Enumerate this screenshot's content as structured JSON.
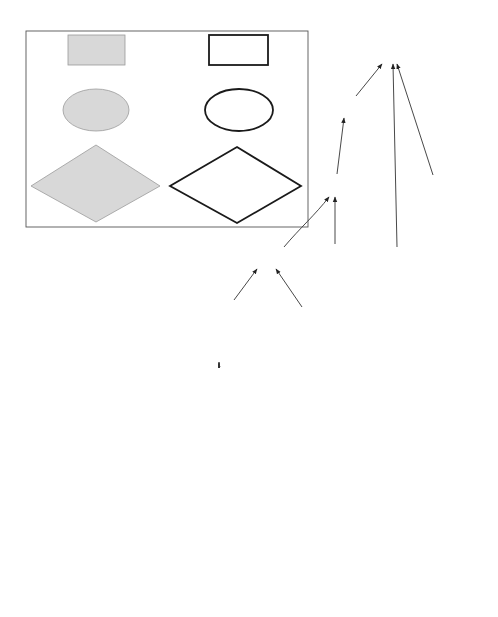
{
  "legend": {
    "source_event": {
      "id": "1.2.3.",
      "l1": "source event and",
      "l2": "its description"
    },
    "internal_event": {
      "id": "1.2.3.",
      "l1": "internal event and",
      "l2": "its description"
    },
    "source_state": {
      "id": "1.2.3.",
      "l1": "source state and",
      "l2": "its description"
    },
    "internal_state": {
      "id": "1.2.3.",
      "l1": "internal state and",
      "l2": "its description"
    },
    "source_process": {
      "id": "1.2.3.",
      "l1": "source process",
      "l2": "= source state/event and",
      "l3": "its description"
    },
    "internal_process": {
      "id": "1.2.3.",
      "l1": "internal process",
      "l2": "= internal state/event and",
      "l3": "its description"
    }
  },
  "nodes": {
    "n0": {
      "id": "0",
      "l1": "accident",
      "shape": "internal-event"
    },
    "n1": {
      "id": "1",
      "l1": "death of 1st person",
      "shape": "internal-event"
    },
    "n2": {
      "id": "2",
      "l1": "death of 2nd person",
      "shape": "internal-event"
    },
    "n21": {
      "id": "2.1",
      "l1": "asphyxiation",
      "shape": "internal-event"
    },
    "n211": {
      "id": "2.1.1",
      "l1": "smoke in cabin",
      "shape": "internal-state"
    },
    "n212": {
      "id": "2.1.2",
      "l1": "remained in cabin",
      "shape": "internal-event"
    },
    "n2121": {
      "id": "2.1.2.1",
      "l1": "unconsciousness",
      "shape": "internal-state"
    },
    "n2122": {
      "id": "2.1.2.2",
      "l1": "unnoticed during",
      "l2": "evacuation",
      "shape": "internal-process"
    },
    "n21221": {
      "id": "2.1.2.2.1",
      "l1": "motionless, noiseless,",
      "l2": "position, smoke in cabin,",
      "l3": "time pressure, etc.",
      "shape": "source-process"
    },
    "n3": {
      "id": "3",
      "l1": "damage to AC",
      "shape": "internal-event"
    },
    "n31": {
      "id": "3.1",
      "l1": "AC hits earth bank",
      "shape": "source-event"
    },
    "n311": {
      "id": "3.1.1",
      "l1": "AC overruns RWY",
      "shape": "source-event"
    },
    "n312": {
      "id": "3.1.2",
      "l1": "earth bank in",
      "l2": "overrun path",
      "shape": "internal-state"
    },
    "n3121": {
      "id": "3.1.2.1",
      "l1": "built by airport",
      "l2": "authority for",
      "l3": "radio equipment",
      "shape": "source-process"
    },
    "n32": {
      "id": "3.2",
      "l1": "AC burns",
      "shape": "internal-state"
    }
  },
  "edges": [
    {
      "from": "2",
      "to": "0",
      "style": "solid"
    },
    {
      "from": "1",
      "to": "0",
      "style": "solid"
    },
    {
      "from": "3",
      "to": "0",
      "style": "solid"
    },
    {
      "from": "2.1",
      "to": "2",
      "style": "solid"
    },
    {
      "from": "2.1.1",
      "to": "2.1",
      "style": "solid"
    },
    {
      "from": "2.1.2",
      "to": "2.1",
      "style": "solid"
    },
    {
      "from": "2.1.2.1",
      "to": "2.1.2",
      "style": "solid"
    },
    {
      "from": "2.1.2.2",
      "to": "2.1.2",
      "style": "solid"
    },
    {
      "from": "2.1.2.2.1",
      "to": "2.1.2.2",
      "style": "solid"
    },
    {
      "from": "3.2",
      "to": "3",
      "style": "solid"
    },
    {
      "from": "3.1",
      "to": "3",
      "style": "solid"
    },
    {
      "from": "3.1",
      "to": "3.2",
      "style": "solid"
    },
    {
      "from": "3.1",
      "to": "1",
      "style": "dashed"
    },
    {
      "from": "3.1",
      "to": "2.1.2.1",
      "style": "dashed"
    },
    {
      "from": "3.2",
      "to": "2.1.1",
      "style": "dashed"
    },
    {
      "from": "3.1.1",
      "to": "3.1",
      "style": "solid"
    },
    {
      "from": "3.1.2",
      "to": "3.1",
      "style": "solid"
    },
    {
      "from": "3.1.2.1",
      "to": "3.1.2",
      "style": "solid"
    }
  ],
  "colors": {
    "source_fill": "#d8d8d8",
    "internal_fill": "#ffffff",
    "stroke": "#1a1a1a"
  }
}
